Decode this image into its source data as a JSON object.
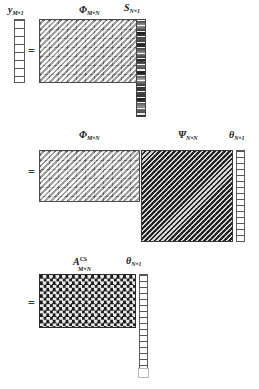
{
  "figure": {
    "background_color": "#ffffff",
    "caption": ""
  },
  "equations": [
    {
      "id": "eq1",
      "equals_sign": "=",
      "terms": [
        {
          "name": "y-vector",
          "symbol": "y",
          "superscript": "",
          "subscript": "M×1",
          "kind": "vector",
          "fill": "white",
          "rows": 8,
          "cols": 1
        },
        {
          "name": "phi-matrix",
          "symbol": "Φ",
          "superscript": "",
          "subscript": "M×N",
          "kind": "matrix",
          "fill": "light-grey-diagonal",
          "rows": 8,
          "cols": 16
        },
        {
          "name": "s-vector",
          "symbol": "S",
          "superscript": "",
          "subscript": "N×1",
          "kind": "vector",
          "fill": "dark-varying",
          "rows": 18,
          "cols": 1
        }
      ]
    },
    {
      "id": "eq2",
      "equals_sign": "=",
      "terms": [
        {
          "name": "phi-matrix-2",
          "symbol": "Φ",
          "superscript": "",
          "subscript": "M×N",
          "kind": "matrix",
          "fill": "light-grey-diagonal",
          "rows": 8,
          "cols": 16
        },
        {
          "name": "psi-matrix",
          "symbol": "Ψ",
          "superscript": "",
          "subscript": "N×N",
          "kind": "matrix",
          "fill": "dark-weave",
          "rows": 24,
          "cols": 24
        },
        {
          "name": "theta-vector",
          "symbol": "θ",
          "superscript": "",
          "subscript": "N×1",
          "kind": "vector",
          "fill": "white",
          "rows": 18,
          "cols": 1
        }
      ]
    },
    {
      "id": "eq3",
      "equals_sign": "=",
      "terms": [
        {
          "name": "acs-matrix",
          "symbol": "A",
          "superscript": "CS",
          "subscript": "M×N",
          "kind": "matrix",
          "fill": "dark-checker",
          "rows": 8,
          "cols": 16
        },
        {
          "name": "theta-vector-2",
          "symbol": "θ",
          "superscript": "",
          "subscript": "N×1",
          "kind": "vector",
          "fill": "white",
          "rows": 18,
          "cols": 1
        }
      ]
    }
  ],
  "colors": {
    "phi": "#d2d2d2",
    "psi": "#6e6e6e",
    "acs": "#1d1d1d",
    "vector_white": "#ffffff",
    "vector_dark": "#2b2b2b",
    "border": "#4a4a4a",
    "text": "#1a1a1a"
  }
}
